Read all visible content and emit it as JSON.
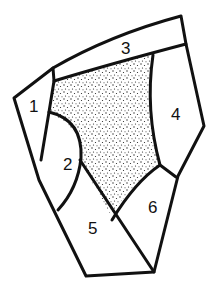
{
  "diagram": {
    "type": "segmented-shape",
    "stroke_color": "#111111",
    "fill_color": "#ffffff",
    "stipple_color": "#222222",
    "regions": [
      {
        "id": "1",
        "label": "1"
      },
      {
        "id": "2",
        "label": "2"
      },
      {
        "id": "3",
        "label": "3"
      },
      {
        "id": "4",
        "label": "4"
      },
      {
        "id": "5",
        "label": "5"
      },
      {
        "id": "6",
        "label": "6"
      },
      {
        "id": "center",
        "label": "",
        "pattern": "stippled"
      }
    ]
  }
}
